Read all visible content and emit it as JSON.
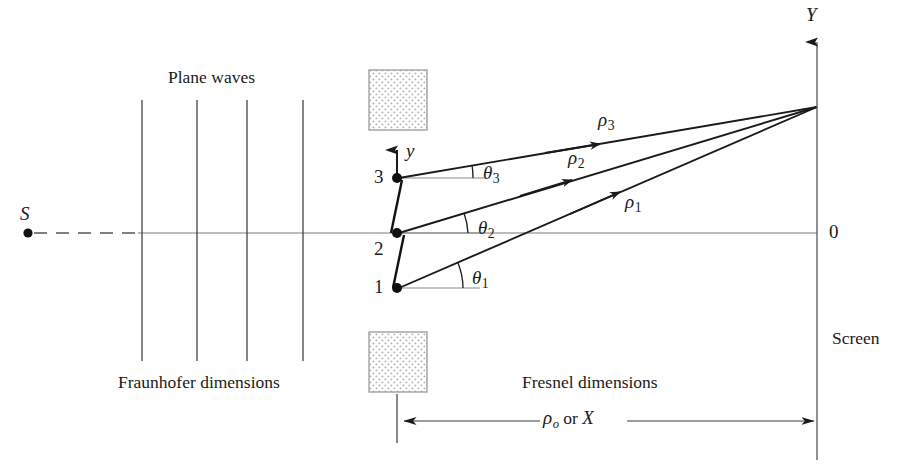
{
  "figure": {
    "name": "fraunhofer-fresnel-diffraction-geometry",
    "background_color": "#ffffff",
    "ink_color": "#1a1a1a",
    "stipple_color": "#b9b9b9",
    "width": 909,
    "height": 468
  },
  "labels": {
    "source": "S",
    "plane_waves": "Plane waves",
    "fraunhofer": "Fraunhofer dimensions",
    "fresnel": "Fresnel dimensions",
    "screen": "Screen",
    "origin": "0",
    "axis_Y": "Y",
    "axis_y": "y",
    "aperture_points": [
      "1",
      "2",
      "3"
    ],
    "rho_symbol": "ρ",
    "theta_symbol": "θ",
    "rho_indices": [
      "1",
      "2",
      "3"
    ],
    "theta_indices": [
      "1",
      "2",
      "3"
    ],
    "dimension_label_symbol": "ρ",
    "dimension_label_subscript": "o",
    "dimension_label_conjunction": "or",
    "dimension_label_alt": "X"
  },
  "geometry": {
    "optical_axis_y": 233,
    "screen_x": 817,
    "convergence_point": [
      817,
      107
    ],
    "source_point": [
      28,
      233
    ],
    "aperture_points": [
      [
        397,
        288
      ],
      [
        397,
        233
      ],
      [
        397,
        178
      ]
    ],
    "wavefront_lines_x": [
      142,
      197,
      247,
      303
    ],
    "wavefront_top_y": 100,
    "wavefront_bottom_y": 361,
    "stipple_square_upper": [
      369,
      70,
      58,
      60
    ],
    "stipple_square_lower": [
      369,
      332,
      58,
      60
    ],
    "dimension_line_y": 421,
    "dimension_line_from_x": 397,
    "dimension_line_to_x": 817
  }
}
